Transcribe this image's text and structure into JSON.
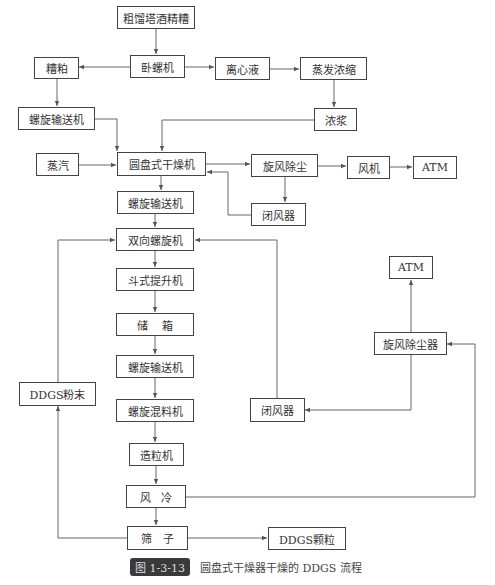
{
  "nodes": {
    "stillage": "粗馏塔酒精糟",
    "decanter": "卧螺机",
    "wet_grains": "糟粕",
    "centrate": "离心液",
    "evaporator": "蒸发浓缩",
    "screw_conveyor_1": "螺旋输送机",
    "syrup": "浓浆",
    "steam": "蒸汽",
    "disc_dryer": "圆盘式干燥机",
    "cyclone_1": "旋风除尘",
    "fan": "风机",
    "atm_1": "ATM",
    "airlock_1": "闭风器",
    "screw_conveyor_2": "螺旋输送机",
    "bidirectional_screw": "双向螺旋机",
    "bucket_elevator": "斗式提升机",
    "storage_bin": "储    箱",
    "screw_conveyor_3": "螺旋输送机",
    "screw_mixer": "螺旋混料机",
    "ddgs_powder": "DDGS粉末",
    "airlock_2": "闭风器",
    "atm_2": "ATM",
    "cyclone_2": "旋风除尘器",
    "pelletizer": "造粒机",
    "air_cooling": "风   冷",
    "screen": "筛   子",
    "ddgs_pellets": "DDGS颗粒"
  },
  "caption": {
    "figure_number": "图 1-3-13",
    "title": "圆盘式干燥器干燥的 DDGS 流程"
  },
  "colors": {
    "line": "#555555",
    "box_border": "#444444",
    "label_bg": "#3a3a3a"
  }
}
